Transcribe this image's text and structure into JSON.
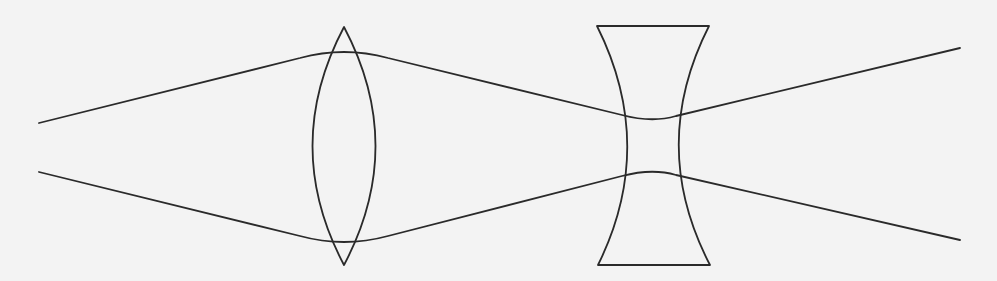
{
  "diagram": {
    "type": "optics-ray-diagram",
    "background_color": "#f3f3f3",
    "stroke_color": "#2a2a2a",
    "elements": [
      {
        "id": "convex-lens",
        "kind": "biconvex lens",
        "center_x": 344,
        "top_y": 27,
        "bottom_y": 265,
        "half_width": 41
      },
      {
        "id": "concave-lens",
        "kind": "biconcave lens",
        "left_x": 597,
        "right_x": 709,
        "top_y": 26,
        "bottom_y": 265,
        "waist_left_x": 637,
        "waist_right_x": 668
      }
    ],
    "rays": [
      {
        "id": "upper-ray",
        "points": [
          [
            39,
            123
          ],
          [
            318,
            55
          ],
          [
            370,
            55
          ],
          [
            638,
            119
          ],
          [
            668,
            119
          ],
          [
            960,
            48
          ]
        ]
      },
      {
        "id": "lower-ray",
        "points": [
          [
            39,
            172
          ],
          [
            318,
            239
          ],
          [
            370,
            239
          ],
          [
            638,
            173
          ],
          [
            668,
            173
          ],
          [
            960,
            240
          ]
        ]
      }
    ]
  }
}
